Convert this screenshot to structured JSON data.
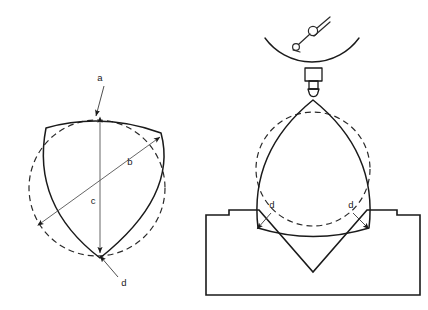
{
  "figure": {
    "background_color": "#ffffff",
    "line_color": "#1a1a1a",
    "panels": [
      {
        "name": "left-panel",
        "description": "Cross-section of a three-lobed constant-diameter part compared with a true circle",
        "elements": [
          {
            "name": "constant-width-profile",
            "style": "solid"
          },
          {
            "name": "reference-circle",
            "style": "dashed"
          },
          {
            "name": "diameter-b",
            "style": "double-arrow"
          },
          {
            "name": "diameter-c",
            "style": "double-arrow"
          }
        ]
      },
      {
        "name": "right-panel",
        "description": "Same part seated in a 90 degree V-block with a dial indicator contacting the top",
        "elements": [
          {
            "name": "dial-indicator-arc",
            "style": "solid"
          },
          {
            "name": "indicator-symbol",
            "style": "solid"
          },
          {
            "name": "probe-body",
            "style": "solid"
          },
          {
            "name": "probe-tip",
            "style": "solid"
          },
          {
            "name": "constant-width-profile",
            "style": "solid"
          },
          {
            "name": "reference-circle",
            "style": "dashed"
          },
          {
            "name": "v-block",
            "style": "solid"
          }
        ]
      }
    ]
  },
  "labels": {
    "a": "a",
    "b": "b",
    "c": "c",
    "d_left": "d",
    "d_right_1": "d",
    "d_right_2": "d"
  },
  "callouts": [
    {
      "id": "a",
      "text": "a",
      "panel": "left",
      "points_to": "reference-circle-top"
    },
    {
      "id": "b",
      "text": "b",
      "panel": "left",
      "points_to": "diameter-across-lobe"
    },
    {
      "id": "c",
      "text": "c",
      "panel": "left",
      "points_to": "vertical-diameter"
    },
    {
      "id": "d-left",
      "text": "d",
      "panel": "left",
      "points_to": "lobe-vertex-bottom"
    },
    {
      "id": "d-right-a",
      "text": "d",
      "panel": "right",
      "points_to": "left-contact-vertex"
    },
    {
      "id": "d-right-b",
      "text": "d",
      "panel": "right",
      "points_to": "right-contact-vertex"
    }
  ],
  "colors": {
    "stroke": "#1a1a1a",
    "dashed_stroke": "#2a2a2a",
    "leader": "#3a3a3a",
    "dimension": "#555555",
    "background": "#ffffff"
  }
}
